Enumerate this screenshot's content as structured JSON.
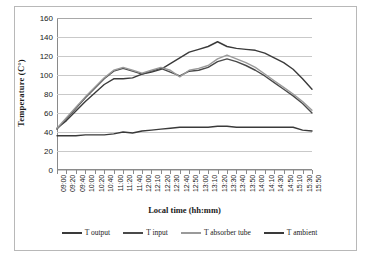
{
  "chart_data": {
    "type": "line",
    "title": "",
    "xlabel": "Local time (hh:mm)",
    "ylabel": "Temperature (C°)",
    "ylim": [
      0,
      160
    ],
    "ytick_step": 20,
    "yticks": [
      "0",
      "20",
      "40",
      "60",
      "80",
      "100",
      "120",
      "140",
      "160"
    ],
    "grid": true,
    "legend_position": "bottom",
    "x": [
      "09:00",
      "09:20",
      "09:40",
      "10:00",
      "10:20",
      "10:40",
      "11:00",
      "11:20",
      "11:40",
      "12:00",
      "12:10",
      "12:20",
      "12:30",
      "12:40",
      "12:50",
      "13:00",
      "13:10",
      "13:20",
      "13:30",
      "13:40",
      "13:50",
      "14:00",
      "14:10",
      "14:30",
      "14:50",
      "15:10",
      "15:30",
      "15:50"
    ],
    "series": [
      {
        "name": "T output",
        "color": "#3a3a3a",
        "values": [
          44,
          52,
          62,
          72,
          81,
          90,
          96,
          96,
          97,
          101,
          103,
          106,
          112,
          118,
          124,
          127,
          130,
          135,
          130,
          128,
          127,
          126,
          123,
          118,
          113,
          106,
          96,
          85
        ]
      },
      {
        "name": "T input",
        "color": "#4a4a4a",
        "values": [
          43,
          54,
          65,
          76,
          86,
          96,
          104,
          107,
          104,
          101,
          104,
          107,
          103,
          99,
          104,
          105,
          108,
          114,
          117,
          114,
          110,
          105,
          99,
          92,
          85,
          78,
          70,
          60
        ]
      },
      {
        "name": "T absorber tube",
        "color": "#9a9a9a",
        "values": [
          44,
          55,
          66,
          77,
          87,
          97,
          105,
          108,
          105,
          102,
          105,
          108,
          105,
          98,
          105,
          107,
          110,
          117,
          121,
          117,
          113,
          108,
          101,
          94,
          87,
          80,
          72,
          63
        ]
      },
      {
        "name": "T ambient",
        "color": "#3a3a3a",
        "values": [
          36,
          36,
          36,
          37,
          37,
          37,
          38,
          40,
          39,
          41,
          42,
          43,
          44,
          45,
          45,
          45,
          45,
          46,
          46,
          45,
          45,
          45,
          45,
          45,
          45,
          45,
          42,
          41
        ]
      }
    ]
  },
  "legend": {
    "items": [
      {
        "label": "T output"
      },
      {
        "label": "T input"
      },
      {
        "label": "T absorber tube"
      },
      {
        "label": "T ambient"
      }
    ]
  }
}
